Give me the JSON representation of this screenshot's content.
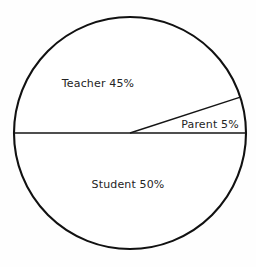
{
  "chart_data": {
    "type": "pie",
    "title": "",
    "subtitle": "",
    "xlabel": "",
    "ylabel": "",
    "grid": false,
    "legend_position": "none",
    "label_style": "inside-slice",
    "units": "percent",
    "total": 100,
    "start_angle_deg": 0,
    "direction": "counterclockwise",
    "categories": [
      "Teacher",
      "Parent",
      "Student"
    ],
    "values": [
      45,
      5,
      50
    ],
    "slices": [
      {
        "name": "Teacher",
        "value": 45,
        "label": "Teacher 45%",
        "percent_text": "45%",
        "angle_deg": 162,
        "start_angle_deg": 18,
        "end_angle_deg": 180,
        "fill": "#ffffff",
        "stroke": "#111111"
      },
      {
        "name": "Parent",
        "value": 5,
        "label": "Parent 5%",
        "percent_text": "5%",
        "angle_deg": 18,
        "start_angle_deg": 0,
        "end_angle_deg": 18,
        "fill": "#ffffff",
        "stroke": "#111111"
      },
      {
        "name": "Student",
        "value": 50,
        "label": "Student 50%",
        "percent_text": "50%",
        "angle_deg": 180,
        "start_angle_deg": 180,
        "end_angle_deg": 360,
        "fill": "#ffffff",
        "stroke": "#111111"
      }
    ]
  },
  "figure": {
    "background": "#fefefe",
    "outline_color": "#111111",
    "divider_color": "#151515",
    "text_color": "#242424",
    "center_x": 130,
    "center_y": 133,
    "radius": 116
  },
  "labels": {
    "teacher": "Teacher 45%",
    "parent": "Parent 5%",
    "student": "Student 50%"
  }
}
